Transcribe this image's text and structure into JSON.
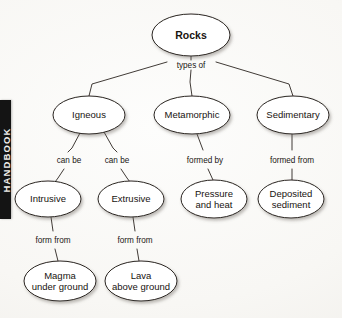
{
  "page": {
    "tab_label": "HANDBOOK",
    "background_color": "#fbfaf8",
    "ink_color": "#17130f",
    "tab_color": "#141414"
  },
  "diagram": {
    "type": "concept-map",
    "title": "Rocks",
    "nodes": [
      {
        "id": "rocks",
        "label": "Rocks",
        "cx": 191,
        "cy": 35,
        "rx": 39,
        "ry": 21,
        "level": 0,
        "bold": true
      },
      {
        "id": "igneous",
        "label": "Igneous",
        "cx": 89,
        "cy": 115,
        "rx": 36,
        "ry": 19,
        "level": 1,
        "bold": false
      },
      {
        "id": "metamorphic",
        "label": "Metamorphic",
        "cx": 192,
        "cy": 115,
        "rx": 38,
        "ry": 19,
        "level": 1,
        "bold": false
      },
      {
        "id": "sedimentary",
        "label": "Sedimentary",
        "cx": 293,
        "cy": 115,
        "rx": 36,
        "ry": 19,
        "level": 1,
        "bold": false
      },
      {
        "id": "intrusive",
        "label": "Intrusive",
        "cx": 48,
        "cy": 199,
        "rx": 33,
        "ry": 18,
        "level": 2,
        "bold": false
      },
      {
        "id": "extrusive",
        "label": "Extrusive",
        "cx": 131,
        "cy": 199,
        "rx": 33,
        "ry": 18,
        "level": 2,
        "bold": false
      },
      {
        "id": "pressure",
        "label": "Pressure\nand heat",
        "cx": 214,
        "cy": 199,
        "rx": 33,
        "ry": 19,
        "level": 2,
        "bold": false
      },
      {
        "id": "deposited",
        "label": "Deposited\nsediment",
        "cx": 291,
        "cy": 199,
        "rx": 33,
        "ry": 19,
        "level": 2,
        "bold": false
      },
      {
        "id": "magma",
        "label": "Magma\nunder ground",
        "cx": 60,
        "cy": 281,
        "rx": 36,
        "ry": 20,
        "level": 3,
        "bold": false
      },
      {
        "id": "lava",
        "label": "Lava\nabove ground",
        "cx": 141,
        "cy": 281,
        "rx": 36,
        "ry": 20,
        "level": 3,
        "bold": false
      }
    ],
    "edges": [
      {
        "id": "e-rocks-hub",
        "from": "rocks",
        "to": "hub",
        "label": "types of",
        "label_x": 191,
        "label_y": 65,
        "points": "191,56 191,60"
      },
      {
        "id": "e-hub-igneous",
        "from": "hub",
        "to": "igneous",
        "label": "",
        "label_x": 0,
        "label_y": 0,
        "points": "167,62 92,84 89,96"
      },
      {
        "id": "e-hub-metamorphic",
        "from": "hub",
        "to": "metamorphic",
        "label": "",
        "label_x": 0,
        "label_y": 0,
        "points": "191,70 190,82 192,96"
      },
      {
        "id": "e-hub-sedimentary",
        "from": "hub",
        "to": "sedimentary",
        "label": "",
        "label_x": 0,
        "label_y": 0,
        "points": "216,62 289,84 293,96"
      },
      {
        "id": "e-igneous-intrusive",
        "from": "igneous",
        "to": "intrusive",
        "label": "can be",
        "label_x": 69,
        "label_y": 160,
        "points": "80,133 72,148 68,152"
      },
      {
        "id": "e-igneous-intrusive2",
        "from": "igneous",
        "to": "intrusive",
        "label": "",
        "label_x": 0,
        "label_y": 0,
        "points": "64,169 58,178 55,182"
      },
      {
        "id": "e-igneous-extrusive",
        "from": "igneous",
        "to": "extrusive",
        "label": "can be",
        "label_x": 117,
        "label_y": 160,
        "points": "104,132 113,148 117,152"
      },
      {
        "id": "e-igneous-extrusive2",
        "from": "igneous",
        "to": "extrusive",
        "label": "",
        "label_x": 0,
        "label_y": 0,
        "points": "121,169 127,178 130,182"
      },
      {
        "id": "e-meta-pressure",
        "from": "metamorphic",
        "to": "pressure",
        "label": "formed by",
        "label_x": 205,
        "label_y": 160,
        "points": "197,134 203,150"
      },
      {
        "id": "e-meta-pressure2",
        "from": "metamorphic",
        "to": "pressure",
        "label": "",
        "label_x": 0,
        "label_y": 0,
        "points": "208,169 213,180"
      },
      {
        "id": "e-sed-deposited",
        "from": "sedimentary",
        "to": "deposited",
        "label": "formed from",
        "label_x": 292,
        "label_y": 160,
        "points": "292,134 292,150"
      },
      {
        "id": "e-sed-deposited2",
        "from": "sedimentary",
        "to": "deposited",
        "label": "",
        "label_x": 0,
        "label_y": 0,
        "points": "292,169 292,180"
      },
      {
        "id": "e-intrusive-magma",
        "from": "intrusive",
        "to": "magma",
        "label": "form from",
        "label_x": 53,
        "label_y": 240,
        "points": "51,217 53,231"
      },
      {
        "id": "e-intrusive-magma2",
        "from": "intrusive",
        "to": "magma",
        "label": "",
        "label_x": 0,
        "label_y": 0,
        "points": "55,249 58,261"
      },
      {
        "id": "e-extrusive-lava",
        "from": "extrusive",
        "to": "lava",
        "label": "form from",
        "label_x": 135,
        "label_y": 240,
        "points": "133,217 135,231"
      },
      {
        "id": "e-extrusive-lava2",
        "from": "extrusive",
        "to": "lava",
        "label": "",
        "label_x": 0,
        "label_y": 0,
        "points": "137,249 139,261"
      }
    ],
    "hub": {
      "x": 191,
      "y": 65
    }
  }
}
